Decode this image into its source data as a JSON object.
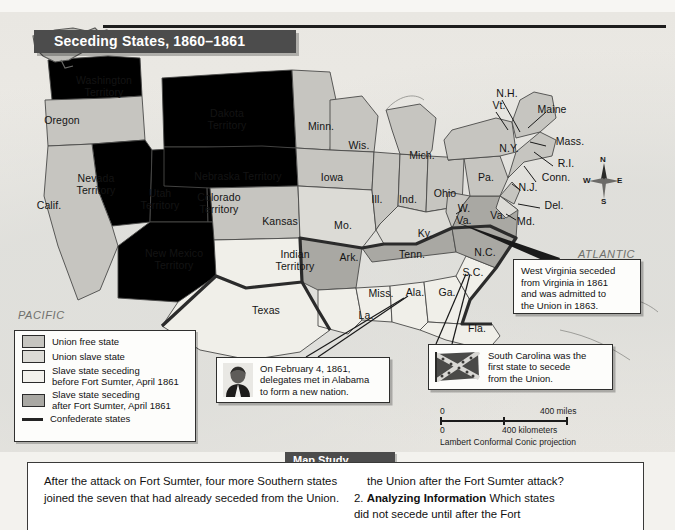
{
  "map": {
    "title": "Seceding States, 1860–1861",
    "ocean_labels": {
      "pacific_line1": "PACIFIC",
      "pacific_line2": "OCEAN",
      "atlantic_line1": "ATLANTIC",
      "atlantic_line2": "OCEAN"
    },
    "compass": {
      "north": "N",
      "east": "E",
      "south": "S",
      "west": "W"
    },
    "scale": {
      "miles_zero": "0",
      "miles_value": "400 miles",
      "km_zero": "0",
      "km_value": "400 kilometers",
      "projection": "Lambert Conformal Conic projection"
    },
    "labels": [
      {
        "name": "washington-territory",
        "text": "Washington\nTerritory",
        "x": 62,
        "y": 75,
        "w": 84,
        "cls": ""
      },
      {
        "name": "oregon",
        "text": "Oregon",
        "x": 24,
        "y": 115,
        "w": 76,
        "cls": ""
      },
      {
        "name": "california",
        "text": "Calif.",
        "x": 26,
        "y": 200,
        "w": 46,
        "cls": ""
      },
      {
        "name": "nevada-territory",
        "text": "Nevada\nTerritory",
        "x": 63,
        "y": 173,
        "w": 66,
        "cls": ""
      },
      {
        "name": "utah-territory",
        "text": "Utah\nTerritory",
        "x": 131,
        "y": 188,
        "w": 58,
        "cls": ""
      },
      {
        "name": "colorado-territory",
        "text": "Colorado\nTerritory",
        "x": 183,
        "y": 192,
        "w": 72,
        "cls": ""
      },
      {
        "name": "new-mexico-territory",
        "text": "New Mexico\nTerritory",
        "x": 124,
        "y": 248,
        "w": 100,
        "cls": ""
      },
      {
        "name": "dakota-territory",
        "text": "Dakota\nTerritory",
        "x": 191,
        "y": 108,
        "w": 72,
        "cls": ""
      },
      {
        "name": "nebraska-territory",
        "text": "Nebraska Territory",
        "x": 177,
        "y": 171,
        "w": 122,
        "cls": ""
      },
      {
        "name": "kansas",
        "text": "Kansas",
        "x": 249,
        "y": 216,
        "w": 62,
        "cls": ""
      },
      {
        "name": "indian-territory",
        "text": "Indian\nTerritory",
        "x": 264,
        "y": 249,
        "w": 62,
        "cls": ""
      },
      {
        "name": "texas",
        "text": "Texas",
        "x": 238,
        "y": 305,
        "w": 56,
        "cls": ""
      },
      {
        "name": "minnesota",
        "text": "Minn.",
        "x": 299,
        "y": 121,
        "w": 44,
        "cls": ""
      },
      {
        "name": "wisconsin",
        "text": "Wis.",
        "x": 340,
        "y": 140,
        "w": 38,
        "cls": ""
      },
      {
        "name": "iowa",
        "text": "Iowa",
        "x": 312,
        "y": 172,
        "w": 40,
        "cls": ""
      },
      {
        "name": "missouri",
        "text": "Mo.",
        "x": 325,
        "y": 220,
        "w": 36,
        "cls": ""
      },
      {
        "name": "illinois",
        "text": "Ill.",
        "x": 364,
        "y": 194,
        "w": 26,
        "cls": ""
      },
      {
        "name": "indiana",
        "text": "Ind.",
        "x": 392,
        "y": 194,
        "w": 32,
        "cls": ""
      },
      {
        "name": "michigan",
        "text": "Mich.",
        "x": 400,
        "y": 150,
        "w": 44,
        "cls": ""
      },
      {
        "name": "ohio",
        "text": "Ohio",
        "x": 424,
        "y": 188,
        "w": 42,
        "cls": ""
      },
      {
        "name": "kentucky",
        "text": "Ky.",
        "x": 410,
        "y": 228,
        "w": 30,
        "cls": ""
      },
      {
        "name": "tennessee",
        "text": "Tenn.",
        "x": 390,
        "y": 249,
        "w": 44,
        "cls": ""
      },
      {
        "name": "arkansas",
        "text": "Ark.",
        "x": 331,
        "y": 252,
        "w": 36,
        "cls": ""
      },
      {
        "name": "louisiana",
        "text": "La.",
        "x": 352,
        "y": 310,
        "w": 28,
        "cls": ""
      },
      {
        "name": "mississippi",
        "text": "Miss.",
        "x": 361,
        "y": 288,
        "w": 40,
        "cls": ""
      },
      {
        "name": "alabama",
        "text": "Ala.",
        "x": 399,
        "y": 287,
        "w": 32,
        "cls": ""
      },
      {
        "name": "georgia",
        "text": "Ga.",
        "x": 432,
        "y": 287,
        "w": 30,
        "cls": ""
      },
      {
        "name": "florida",
        "text": "Fla.",
        "x": 462,
        "y": 323,
        "w": 30,
        "cls": ""
      },
      {
        "name": "south-carolina",
        "text": "S.C.",
        "x": 457,
        "y": 267,
        "w": 32,
        "cls": ""
      },
      {
        "name": "north-carolina",
        "text": "N.C.",
        "x": 468,
        "y": 247,
        "w": 34,
        "cls": ""
      },
      {
        "name": "virginia",
        "text": "Va.",
        "x": 484,
        "y": 210,
        "w": 28,
        "cls": ""
      },
      {
        "name": "west-virginia",
        "text": "W.\nVa.",
        "x": 452,
        "y": 203,
        "w": 24,
        "cls": ""
      },
      {
        "name": "pennsylvania",
        "text": "Pa.",
        "x": 472,
        "y": 172,
        "w": 28,
        "cls": ""
      },
      {
        "name": "new-york",
        "text": "N.Y.",
        "x": 492,
        "y": 143,
        "w": 34,
        "cls": ""
      },
      {
        "name": "maine",
        "text": "Maine",
        "x": 529,
        "y": 104,
        "w": 46,
        "cls": ""
      },
      {
        "name": "new-hampshire",
        "text": "N.H.",
        "x": 490,
        "y": 88,
        "w": 34,
        "cls": ""
      },
      {
        "name": "vermont",
        "text": "Vt.",
        "x": 486,
        "y": 100,
        "w": 26,
        "cls": ""
      },
      {
        "name": "massachusetts",
        "text": "Mass.",
        "x": 548,
        "y": 136,
        "w": 44,
        "cls": ""
      },
      {
        "name": "rhode-island",
        "text": "R.I.",
        "x": 551,
        "y": 158,
        "w": 30,
        "cls": ""
      },
      {
        "name": "connecticut",
        "text": "Conn.",
        "x": 534,
        "y": 172,
        "w": 44,
        "cls": ""
      },
      {
        "name": "new-jersey",
        "text": "N.J.",
        "x": 513,
        "y": 182,
        "w": 30,
        "cls": ""
      },
      {
        "name": "delaware",
        "text": "Del.",
        "x": 538,
        "y": 200,
        "w": 32,
        "cls": ""
      },
      {
        "name": "maryland",
        "text": "Md.",
        "x": 510,
        "y": 216,
        "w": 32,
        "cls": ""
      }
    ]
  },
  "legend": {
    "items": [
      {
        "swatch": "free",
        "label": "Union free state"
      },
      {
        "swatch": "uslave",
        "label": "Union slave state"
      },
      {
        "swatch": "before",
        "label": "Slave state seceding\nbefore Fort Sumter, April 1861"
      },
      {
        "swatch": "after",
        "label": "Slave state seceding\nafter Fort Sumter, April 1861"
      },
      {
        "swatch": "line",
        "label": "Confederate states"
      }
    ]
  },
  "callouts": {
    "alabama": {
      "icon": "portrait-jefferson-davis",
      "text": "On February 4, 1861,\ndelegates met in Alabama\nto form a new nation."
    },
    "west_virginia": {
      "text": "West Virginia seceded\nfrom Virginia in 1861\nand was admitted to\nthe Union in 1863."
    },
    "south_carolina": {
      "icon": "confederate-battle-flag",
      "text": "South Carolina was the\nfirst state to secede\nfrom the Union."
    }
  },
  "map_study": {
    "heading": "Map Study",
    "left_text": "After the attack on Fort Sumter, four more Southern states joined the seven that had already seceded from the Union.",
    "right_q1_continuation": "the Union after the Fort Sumter attack?",
    "right_q2_number": "2.",
    "right_q2_bold": "Analyzing Information",
    "right_q2_rest": " Which states",
    "right_q2_line2": "did not secede until after the Fort"
  }
}
